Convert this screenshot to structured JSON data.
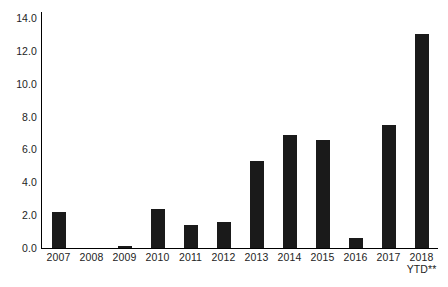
{
  "chart_data": {
    "type": "bar",
    "title": "",
    "subtitle": "",
    "xlabel": "",
    "ylabel": "",
    "categories": [
      "2007",
      "2008",
      "2009",
      "2010",
      "2011",
      "2012",
      "2013",
      "2014",
      "2015",
      "2016",
      "2017",
      "2018"
    ],
    "category_sublabels": [
      "",
      "",
      "",
      "",
      "",
      "",
      "",
      "",
      "",
      "",
      "",
      "YTD**"
    ],
    "values": [
      2.2,
      0.0,
      0.1,
      2.4,
      1.4,
      1.6,
      5.3,
      6.9,
      6.6,
      0.6,
      7.5,
      13.0
    ],
    "ylim": [
      0.0,
      14.0
    ],
    "ytick_labels": [
      "0.0",
      "2.0",
      "4.0",
      "6.0",
      "8.0",
      "10.0",
      "12.0",
      "14.0"
    ],
    "ytick_values": [
      0.0,
      2.0,
      4.0,
      6.0,
      8.0,
      10.0,
      12.0,
      14.0
    ],
    "grid": false,
    "legend": null,
    "bar_color": "#1a1a1a",
    "axis_color": "#000000",
    "text_color": "#232323",
    "background_color": "#ffffff",
    "annotations": []
  }
}
